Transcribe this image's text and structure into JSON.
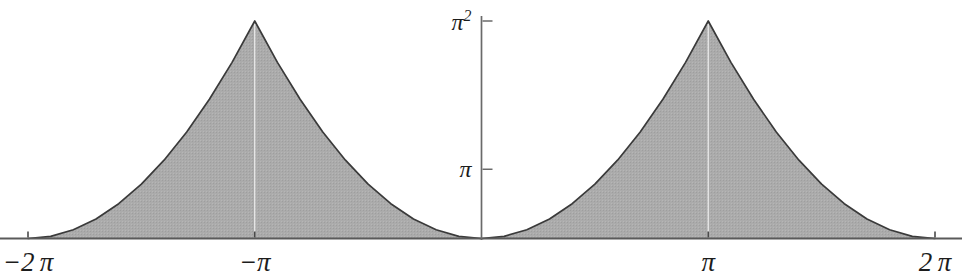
{
  "chart_data": {
    "type": "area",
    "title": "",
    "subtitle": "",
    "xlabel": "",
    "ylabel": "",
    "xlim": [
      -6.283185307,
      6.283185307
    ],
    "ylim": [
      0,
      9.8696044
    ],
    "grid": false,
    "legend": null,
    "legend_position": "none",
    "x_ticks": [
      {
        "value": -6.283185307,
        "label": "−2 π"
      },
      {
        "value": -3.141592653,
        "label": "−π"
      },
      {
        "value": 3.141592653,
        "label": "π"
      },
      {
        "value": 6.283185307,
        "label": "2 π"
      }
    ],
    "y_ticks": [
      {
        "value": 9.8696044,
        "label": "π²",
        "base": "π",
        "exponent": "2"
      },
      {
        "value": 3.141592653,
        "label": "π",
        "base": "π",
        "exponent": ""
      }
    ],
    "series": [
      {
        "name": "x² (periodic, period 2π)",
        "fill_color": "#a9a9a9",
        "line_color": "#3a3a3a",
        "points_x": [
          -6.283185307,
          -5.969026042,
          -5.654866776,
          -5.340707511,
          -5.026548246,
          -4.71238898,
          -4.398229715,
          -4.08407045,
          -3.769911184,
          -3.455751919,
          -3.141592653,
          -2.827433388,
          -2.513274123,
          -2.199114857,
          -1.884955592,
          -1.570796327,
          -1.256637061,
          -0.942477796,
          -0.628318531,
          -0.314159265,
          0.0,
          0.314159265,
          0.628318531,
          0.942477796,
          1.256637061,
          1.570796327,
          1.884955592,
          2.199114857,
          2.513274123,
          2.827433388,
          3.141592653,
          3.455751919,
          3.769911184,
          4.08407045,
          4.398229715,
          4.71238898,
          5.026548246,
          5.340707511,
          5.654866776,
          5.969026042,
          6.283185307
        ],
        "points_y": [
          0.0,
          0.098696,
          0.3947842,
          0.8882644,
          1.5791367,
          2.4674011,
          3.5530576,
          4.8361061,
          6.3165468,
          7.9943795,
          9.8696044,
          7.9943795,
          6.3165468,
          4.8361061,
          3.5530576,
          2.4674011,
          1.5791367,
          0.8882644,
          0.3947842,
          0.098696,
          0.0,
          0.098696,
          0.3947842,
          0.8882644,
          1.5791367,
          2.4674011,
          3.5530576,
          4.8361061,
          6.3165468,
          7.9943795,
          9.8696044,
          7.9943795,
          6.3165468,
          4.8361061,
          3.5530576,
          2.4674011,
          1.5791367,
          0.8882644,
          0.3947842,
          0.098696,
          0.0
        ]
      }
    ],
    "annotations": [
      {
        "name": "peak-marker-left",
        "x": -3.141592653,
        "note": "thin white vertical line at peak"
      },
      {
        "name": "peak-marker-right",
        "x": 3.141592653,
        "note": "thin white vertical line at peak"
      }
    ],
    "colors": {
      "fill": "#a9a9a9",
      "curve": "#3a3a3a",
      "axis": "#5a5a5a",
      "text": "#1c1c1c",
      "background": "#ffffff"
    }
  },
  "axes": {
    "x_axis_name": "x-axis",
    "y_axis_name": "y-axis"
  }
}
